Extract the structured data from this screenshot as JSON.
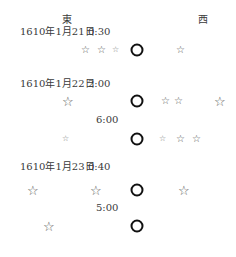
{
  "directions": {
    "east": "東",
    "west": "西"
  },
  "observations": [
    {
      "date": "1610年1月21日",
      "time": "0:30"
    },
    {
      "date": "1610年1月22日",
      "time": "2:00",
      "sub_time": "6:00"
    },
    {
      "date": "1610年1月23日",
      "time": "0:40",
      "sub_time": "5:00"
    }
  ],
  "glyphs": {
    "star": "☆"
  }
}
